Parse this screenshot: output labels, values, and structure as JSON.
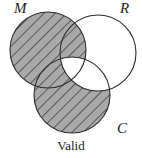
{
  "diagram": {
    "type": "venn-3",
    "caption": "Valid",
    "circles": [
      {
        "id": "M",
        "label": "M",
        "cx": 48,
        "cy": 50,
        "r": 38
      },
      {
        "id": "R",
        "label": "R",
        "cx": 98,
        "cy": 53,
        "r": 38
      },
      {
        "id": "C",
        "label": "C",
        "cx": 72,
        "cy": 95,
        "r": 38
      }
    ],
    "labels": {
      "M": "M",
      "R": "R",
      "C": "C"
    },
    "shaded_regions": [
      "M only",
      "M∩R not C",
      "M∩C not R",
      "C only"
    ],
    "unshaded_regions": [
      "R only",
      "R∩C not M",
      "M∩R∩C"
    ],
    "colors": {
      "shade_fill": "#a9a9a9",
      "hatch_line": "#2a2a2a",
      "outline": "#2a2a2a",
      "background": "#ffffff"
    }
  }
}
